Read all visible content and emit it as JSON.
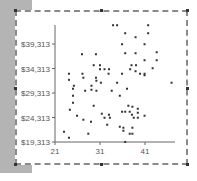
{
  "chart_data": {
    "type": "scatter",
    "title": "",
    "xlabel": "",
    "ylabel": "",
    "x_ticks": [
      "21",
      "31",
      "41"
    ],
    "y_ticks": [
      "$19,313",
      "$24,313",
      "$29,313",
      "$34,313",
      "$39,313"
    ],
    "xlim": [
      21,
      48
    ],
    "ylim": [
      19313,
      43200
    ],
    "grid": false,
    "legend": null,
    "points": [
      [
        33.9,
        43143
      ],
      [
        34.8,
        43143
      ],
      [
        41.7,
        43143
      ],
      [
        36.6,
        41511
      ],
      [
        41.7,
        41511
      ],
      [
        38.9,
        40695
      ],
      [
        35.9,
        39266
      ],
      [
        40.9,
        39266
      ],
      [
        27.0,
        37225
      ],
      [
        30.1,
        37225
      ],
      [
        36.6,
        37429
      ],
      [
        38.9,
        37429
      ],
      [
        43.6,
        37633
      ],
      [
        40.9,
        36000
      ],
      [
        43.6,
        36000
      ],
      [
        38.0,
        34980
      ],
      [
        39.0,
        34980
      ],
      [
        29.6,
        34980
      ],
      [
        31.0,
        34980
      ],
      [
        31.0,
        34163
      ],
      [
        32.0,
        34163
      ],
      [
        42.7,
        34366
      ],
      [
        38.9,
        33755
      ],
      [
        37.7,
        34163
      ],
      [
        33.0,
        34163
      ],
      [
        24.1,
        33245
      ],
      [
        27.1,
        33245
      ],
      [
        32.9,
        33245
      ],
      [
        35.9,
        33245
      ],
      [
        39.9,
        33245
      ],
      [
        40.9,
        33245
      ],
      [
        40.9,
        32939
      ],
      [
        27.3,
        32429
      ],
      [
        30.1,
        32429
      ],
      [
        24.1,
        32000
      ],
      [
        31.2,
        31408
      ],
      [
        30.2,
        31816
      ],
      [
        34.8,
        31408
      ],
      [
        46.9,
        31408
      ],
      [
        25.2,
        30796
      ],
      [
        29.1,
        30796
      ],
      [
        29.1,
        29980
      ],
      [
        37.0,
        30184
      ],
      [
        25.0,
        30184
      ],
      [
        27.7,
        29776
      ],
      [
        30.2,
        29776
      ],
      [
        33.6,
        29776
      ],
      [
        35.4,
        28755
      ],
      [
        25.0,
        28755
      ],
      [
        25.0,
        27326
      ],
      [
        29.6,
        26714
      ],
      [
        37.3,
        26714
      ],
      [
        38.2,
        26510
      ],
      [
        39.4,
        26102
      ],
      [
        24.3,
        25898
      ],
      [
        35.9,
        25490
      ],
      [
        36.6,
        25490
      ],
      [
        37.6,
        25490
      ],
      [
        39.4,
        25286
      ],
      [
        31.4,
        25082
      ],
      [
        33.0,
        24878
      ],
      [
        38.1,
        24878
      ],
      [
        25.9,
        24673
      ],
      [
        32.0,
        24265
      ],
      [
        33.2,
        24265
      ],
      [
        38.5,
        24265
      ],
      [
        39.4,
        24265
      ],
      [
        40.9,
        24673
      ],
      [
        27.3,
        23857
      ],
      [
        29.0,
        23449
      ],
      [
        35.4,
        22429
      ],
      [
        36.2,
        22224
      ],
      [
        38.2,
        22224
      ],
      [
        32.6,
        22837
      ],
      [
        36.2,
        21612
      ],
      [
        37.6,
        21000
      ],
      [
        38.2,
        21000
      ],
      [
        28.4,
        21000
      ],
      [
        23.0,
        21408
      ],
      [
        24.1,
        20184
      ],
      [
        36.6,
        19313
      ]
    ]
  }
}
